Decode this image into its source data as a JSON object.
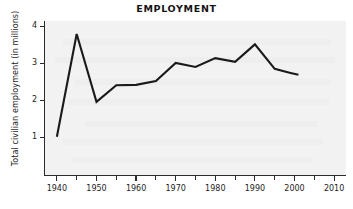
{
  "chart_data": {
    "type": "line",
    "title": "EMPLOYMENT",
    "xlabel": "",
    "ylabel": "Total civilian employment (in millions)",
    "xlim": [
      1937,
      2013
    ],
    "ylim": [
      0,
      4.15
    ],
    "xticks": [
      1940,
      1950,
      1960,
      1970,
      1980,
      1990,
      2000,
      2010
    ],
    "xticklabels": [
      "1940",
      "1950",
      "1960",
      "1970",
      "1980",
      "1990",
      "2000",
      "2010"
    ],
    "xminorticks": [
      1945,
      1955,
      1965,
      1975,
      1985,
      1995,
      2005
    ],
    "yticks": [
      1,
      2,
      3,
      4
    ],
    "yticklabels": [
      "1",
      "2",
      "3",
      "4"
    ],
    "grid": false,
    "legend": null,
    "series": [
      {
        "name": "Total civilian employment",
        "color": "#1a1a1a",
        "x": [
          1940,
          1945,
          1950,
          1955,
          1960,
          1965,
          1970,
          1975,
          1980,
          1985,
          1990,
          1995,
          1999,
          2001
        ],
        "values": [
          1.03,
          3.8,
          1.97,
          2.42,
          2.43,
          2.53,
          3.02,
          2.91,
          3.15,
          3.05,
          3.52,
          2.86,
          2.75,
          2.7
        ]
      }
    ]
  },
  "axes": {
    "y_title": "Total civilian employment (in millions)",
    "y_tick_labels": [
      "4",
      "3",
      "2",
      "1"
    ],
    "x_tick_labels": [
      "1940",
      "1950",
      "1960",
      "1970",
      "1980",
      "1990",
      "2000",
      "2010"
    ]
  },
  "colors": {
    "line": "#1a1a1a",
    "plot_background": "#f2f2f2",
    "axis": "#2b2b2b",
    "text": "#1d1d1d",
    "page_background": "#ffffff"
  }
}
